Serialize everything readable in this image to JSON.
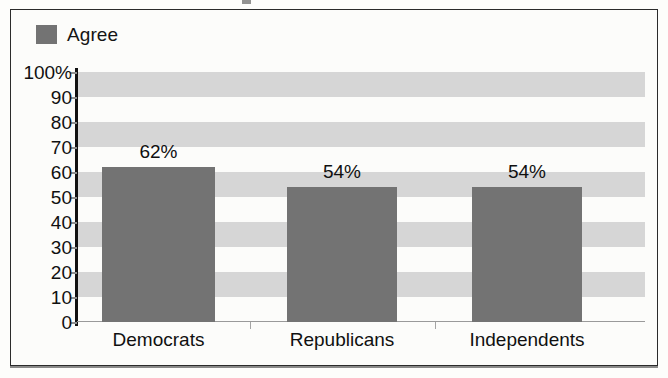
{
  "legend": {
    "entries": [
      {
        "label": "Agree",
        "color": "#737373"
      }
    ]
  },
  "axis": {
    "y_ticks": [
      "100%",
      "90",
      "80",
      "70",
      "60",
      "50",
      "40",
      "30",
      "20",
      "10",
      "0"
    ]
  },
  "bars": [
    {
      "category": "Democrats",
      "value_label": "62%"
    },
    {
      "category": "Republicans",
      "value_label": "54%"
    },
    {
      "category": "Independents",
      "value_label": "54%"
    }
  ],
  "chart_data": {
    "type": "bar",
    "title": "",
    "subtitle": "",
    "xlabel": "",
    "ylabel": "",
    "categories": [
      "Democrats",
      "Republicans",
      "Independents"
    ],
    "values": [
      62,
      54,
      54
    ],
    "data_labels": [
      "62%",
      "54%",
      "54%"
    ],
    "series": [
      {
        "name": "Agree",
        "values": [
          62,
          54,
          54
        ],
        "color": "#737373"
      }
    ],
    "ylim": [
      0,
      100
    ],
    "ytick_values": [
      0,
      10,
      20,
      30,
      40,
      50,
      60,
      70,
      80,
      90,
      100
    ],
    "ytick_labels": [
      "0",
      "10",
      "20",
      "30",
      "40",
      "50",
      "60",
      "70",
      "80",
      "90",
      "100%"
    ],
    "grid": "horizontal-alternating-bands",
    "band_color": "#d6d6d6",
    "legend_position": "top-left",
    "bar_color": "#737373",
    "background": "#fcfcfa"
  }
}
